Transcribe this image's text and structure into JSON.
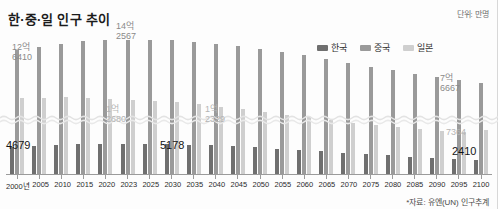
{
  "header": {
    "title": "한·중·일 인구 추이",
    "unit_note": "단위: 만명",
    "source_note": "*자료: 유엔(UN) 인구추계"
  },
  "legend": {
    "items": [
      {
        "label": "한국",
        "color": "#6f6f6f"
      },
      {
        "label": "중국",
        "color": "#9a9a9a"
      },
      {
        "label": "일본",
        "color": "#cfcfcf"
      }
    ]
  },
  "callouts": [
    {
      "id": "cn2000",
      "series": "중국",
      "year": "2000년",
      "big": "12억",
      "small": "6410"
    },
    {
      "id": "cn2023",
      "series": "중국",
      "year": "2023",
      "big": "14억",
      "small": "2567"
    },
    {
      "id": "cn2100",
      "series": "중국",
      "year": "2100",
      "big": "7억",
      "small": "6667"
    },
    {
      "id": "jp2000",
      "series": "일본",
      "year": "2000년",
      "big": "1억",
      "small": "2680"
    },
    {
      "id": "jp2023",
      "series": "일본",
      "year": "2023",
      "big": "1억",
      "small": "2329"
    },
    {
      "id": "jp2100",
      "series": "일본",
      "year": "2100",
      "big": "",
      "small": "7364"
    },
    {
      "id": "kr2000",
      "series": "한국",
      "year": "2000년",
      "value": "4679"
    },
    {
      "id": "kr2023",
      "series": "한국",
      "year": "2023",
      "value": "5178"
    },
    {
      "id": "kr2100",
      "series": "한국",
      "year": "2100",
      "value": "2410"
    }
  ],
  "chart_data": {
    "type": "bar",
    "title": "한·중·일 인구 추이",
    "subtitle": "",
    "xlabel": "",
    "ylabel": "",
    "unit": "만명",
    "source": "*자료: 유엔(UN) 인구추계",
    "legend_position": "top-right",
    "grid": false,
    "axis_break": true,
    "ylim": [
      0,
      14500
    ],
    "categories": [
      "2000년",
      "2005",
      "2010",
      "2015",
      "2020",
      "2023",
      "2025",
      "2030",
      "2035",
      "2040",
      "2045",
      "2050",
      "2055",
      "2060",
      "2065",
      "2070",
      "2075",
      "2080",
      "2085",
      "2090",
      "2095",
      "2100"
    ],
    "series": [
      {
        "name": "한국",
        "color": "#6f6f6f",
        "values": [
          4679,
          4818,
          4955,
          5101,
          5184,
          5178,
          5168,
          5120,
          5030,
          4916,
          4771,
          4587,
          4372,
          4142,
          3907,
          3676,
          3452,
          3234,
          3027,
          2837,
          2617,
          2410
        ]
      },
      {
        "name": "중국",
        "color": "#9a9a9a",
        "values": [
          126410,
          131400,
          136000,
          140000,
          142100,
          142567,
          142500,
          141500,
          139500,
          136500,
          132800,
          128700,
          124000,
          118800,
          113200,
          107500,
          101600,
          95800,
          90400,
          85400,
          80800,
          76667
        ]
      },
      {
        "name": "일본",
        "color": "#cfcfcf",
        "values": [
          12680,
          12780,
          12830,
          12710,
          12560,
          12329,
          12250,
          12000,
          11670,
          11280,
          10860,
          10420,
          9970,
          9520,
          9080,
          8650,
          8250,
          7880,
          7560,
          7290,
          7060,
          7364
        ]
      }
    ]
  }
}
